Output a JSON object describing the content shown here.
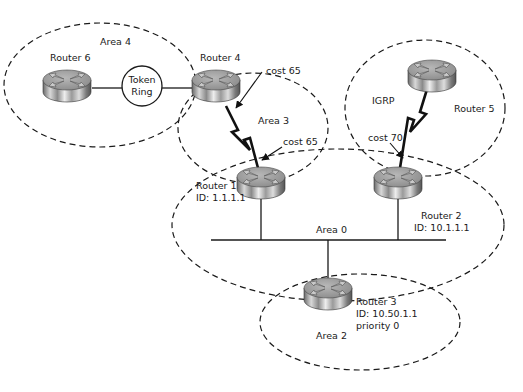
{
  "diagram": {
    "areas": [
      {
        "id": "area4",
        "label": "Area 4"
      },
      {
        "id": "area3",
        "label": "Area 3"
      },
      {
        "id": "igrp",
        "label": "IGRP"
      },
      {
        "id": "area0",
        "label": "Area 0"
      },
      {
        "id": "area2",
        "label": "Area 2"
      }
    ],
    "routers": [
      {
        "id": "router6",
        "name": "Router 6"
      },
      {
        "id": "router4",
        "name": "Router 4"
      },
      {
        "id": "router5",
        "name": "Router 5"
      },
      {
        "id": "router1",
        "name": "Router 1",
        "id_label": "ID: 1.1.1.1"
      },
      {
        "id": "router2",
        "name": "Router 2",
        "id_label": "ID: 10.1.1.1"
      },
      {
        "id": "router3",
        "name": "Router 3",
        "id_label": "ID: 10.50.1.1",
        "priority": "priority 0"
      }
    ],
    "token_ring": {
      "line1": "Token",
      "line2": "Ring"
    },
    "costs": [
      {
        "id": "cost_r4",
        "label": "cost 65"
      },
      {
        "id": "cost_r1",
        "label": "cost 65"
      },
      {
        "id": "cost_r2",
        "label": "cost 70"
      }
    ]
  }
}
